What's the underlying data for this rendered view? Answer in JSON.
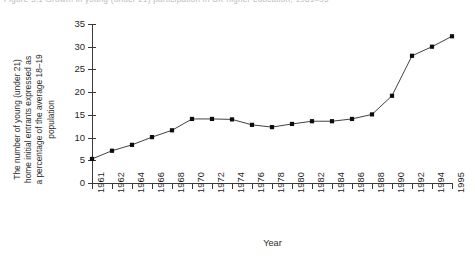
{
  "caption_fragment": "Figure 5.1  Growth in young (under 21) participation in UK higher education, 1961–95",
  "chart_data": {
    "type": "line",
    "title": "",
    "xlabel": "Year",
    "ylabel": "The number of young (under 21)\nhome initial entrants expressed as\na percentage of the average 18–19\npopulation",
    "xlim": [
      0,
      18
    ],
    "ylim": [
      0,
      35
    ],
    "grid": false,
    "legend": "none",
    "marker": "square",
    "marker_color": "#0d0d0d",
    "line_color": "#2c2c2c",
    "y_ticks": [
      0,
      5,
      10,
      15,
      20,
      25,
      30,
      35
    ],
    "categories": [
      "1961",
      "1962",
      "1964",
      "1966",
      "1968",
      "1970",
      "1972",
      "1974",
      "1976",
      "1978",
      "1980",
      "1982",
      "1984",
      "1986",
      "1988",
      "1990",
      "1992",
      "1994",
      "1995"
    ],
    "values": [
      5.3,
      7.1,
      8.4,
      10.1,
      11.6,
      14.1,
      14.1,
      14.0,
      12.8,
      12.3,
      13.0,
      13.6,
      13.6,
      14.1,
      15.1,
      19.2,
      28.0,
      30.0,
      32.3
    ]
  }
}
